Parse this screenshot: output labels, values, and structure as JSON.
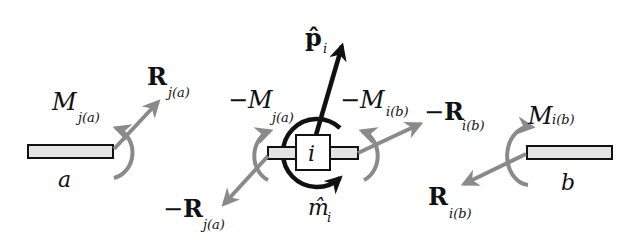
{
  "colors": {
    "black": "#111111",
    "gray_arrow": "#8a8a8a",
    "bar_fill": "#e4e4e4",
    "bar_stroke": "#111111",
    "background": "#ffffff"
  },
  "bodies": {
    "a": {
      "label": "a"
    },
    "b": {
      "label": "b"
    },
    "i": {
      "label": "i"
    }
  },
  "labels": {
    "M_ja": {
      "pre": "",
      "main": "M",
      "sub": "j(a)"
    },
    "R_ja": {
      "pre": "",
      "main": "R",
      "sub": "j(a)"
    },
    "negM_ja": {
      "pre": "−",
      "main": "M",
      "sub": "j(a)"
    },
    "negR_ja": {
      "pre": "−",
      "main": "R",
      "sub": "j(a)"
    },
    "p_hat_i": {
      "pre": "",
      "main": "p̂",
      "sub": "i"
    },
    "m_hat_i": {
      "pre": "",
      "main": "m̂",
      "sub": "i"
    },
    "negM_ib": {
      "pre": "−",
      "main": "M",
      "sub": "i(b)"
    },
    "negR_ib": {
      "pre": "−",
      "main": "R",
      "sub": "i(b)"
    },
    "M_ib": {
      "pre": "",
      "main": "M",
      "sub": "i(b)"
    },
    "R_ib": {
      "pre": "",
      "main": "R",
      "sub": "i(b)"
    }
  }
}
